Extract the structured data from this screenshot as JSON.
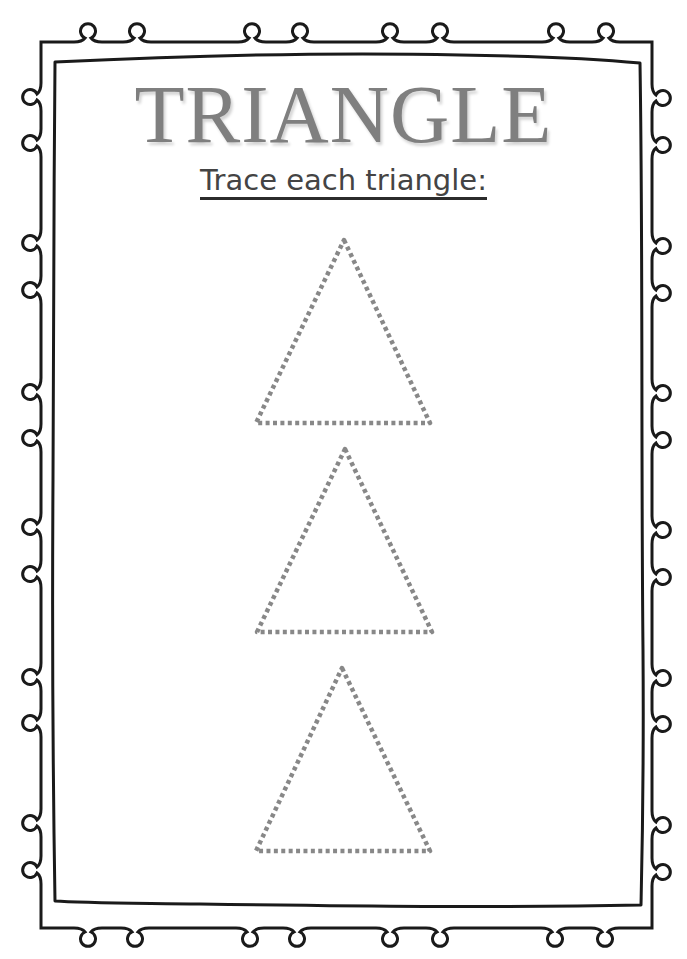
{
  "worksheet": {
    "title": "TRIANGLE",
    "instruction": "Trace each triangle:",
    "colors": {
      "title": "#7f7f7f",
      "instruction": "#444444",
      "border": "#1a1a1a",
      "trace_dots": "#888888",
      "background": "#ffffff"
    },
    "traceable_shapes": [
      {
        "shape": "triangle",
        "style": "dotted",
        "points": [
          [
            344,
            240
          ],
          [
            430,
            423
          ],
          [
            256,
            423
          ]
        ]
      },
      {
        "shape": "triangle",
        "style": "dotted",
        "points": [
          [
            345,
            449
          ],
          [
            432,
            632
          ],
          [
            257,
            632
          ]
        ]
      },
      {
        "shape": "triangle",
        "style": "dotted",
        "points": [
          [
            342,
            668
          ],
          [
            430,
            851
          ],
          [
            256,
            851
          ]
        ]
      }
    ],
    "border": {
      "style": "double-line-with-loops",
      "top_loops_x": [
        88,
        137,
        252,
        300,
        390,
        440,
        556,
        606
      ],
      "bottom_loops_x": [
        88,
        135,
        250,
        297,
        390,
        440,
        555,
        605
      ],
      "left_loops_y": [
        97,
        143,
        243,
        290,
        392,
        438,
        527,
        574,
        677,
        723,
        823,
        870
      ],
      "right_loops_y": [
        98,
        145,
        246,
        293,
        393,
        440,
        530,
        577,
        678,
        724,
        825,
        872
      ]
    }
  }
}
